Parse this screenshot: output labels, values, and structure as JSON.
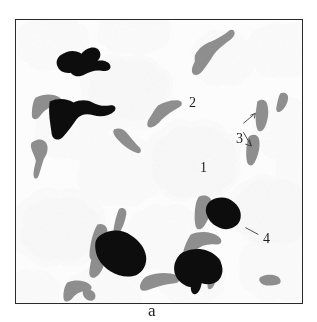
{
  "figure": {
    "kind": "micrograph-panel",
    "frame": {
      "border_color": "#2a2a2a",
      "background_color": "#fbfbfb"
    },
    "caption_partial": "a",
    "labels": [
      {
        "id": "1",
        "text": "1",
        "target": "light-gray-cluster",
        "has_leader": false
      },
      {
        "id": "2",
        "text": "2",
        "target": "gray-elongated-fragment",
        "has_leader": false
      },
      {
        "id": "3",
        "text": "3",
        "target": "gray-rod-pair",
        "has_leader": true,
        "leader_count": 2
      },
      {
        "id": "4",
        "text": "4",
        "target": "black-dense-mass",
        "has_leader": true,
        "leader_count": 1
      }
    ],
    "legend": {
      "cluster_color": "#e9e9e9",
      "fragment_color": "#9a9a9a",
      "dense_color": "#0d0d0d",
      "background_color": "#fbfbfb"
    },
    "feature_counts": {
      "light_clusters": 17,
      "gray_fragments": 16,
      "black_masses": 5
    }
  }
}
